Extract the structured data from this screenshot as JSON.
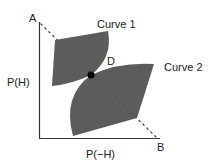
{
  "diagram": {
    "labels": {
      "point_a": "A",
      "point_b": "B",
      "point_d": "D",
      "curve_1": "Curve 1",
      "curve_2": "Curve 2",
      "y_axis": "P(H)",
      "x_axis": "P(−H)"
    },
    "colors": {
      "region_fill": "#5c5c5c",
      "axis": "#333333",
      "dashed_line": "#555555",
      "point_d": "#000000",
      "background": "#ffffff"
    }
  }
}
